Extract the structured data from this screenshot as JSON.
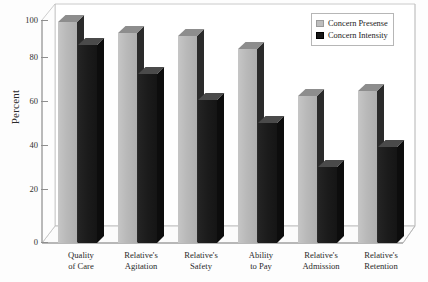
{
  "chart_data": {
    "type": "bar",
    "title": "",
    "xlabel": "",
    "ylabel": "Percent",
    "ylim": [
      0,
      100
    ],
    "yticks": [
      0,
      20,
      40,
      60,
      80,
      100
    ],
    "grid": false,
    "legend_position": "top-right",
    "style": "3d-grouped-bar",
    "categories": [
      "Quality\nof Care",
      "Relative's\nAgitation",
      "Relative's\nSafety",
      "Ability\nto Pay",
      "Relative's\nAdmission",
      "Relative's\nRetention"
    ],
    "category_lines": [
      [
        "Quality",
        "of Care"
      ],
      [
        "Relative's",
        "Agitation"
      ],
      [
        "Relative's",
        "Safety"
      ],
      [
        "Ability",
        "to Pay"
      ],
      [
        "Relative's",
        "Admission"
      ],
      [
        "Relative's",
        "Retention"
      ]
    ],
    "series": [
      {
        "name": "Concern Presense",
        "color": "#bdbdbd",
        "values": [
          99,
          94,
          93,
          87,
          66,
          68
        ]
      },
      {
        "name": "Concern Intensity",
        "color": "#171717",
        "values": [
          89,
          76,
          64,
          54,
          34,
          43
        ]
      }
    ]
  },
  "axis": {
    "y_title": "Percent",
    "y_tick_labels": [
      "100",
      "80",
      "60",
      "40",
      "20",
      "0"
    ]
  },
  "legend": {
    "items": [
      {
        "label": "Concern Presense"
      },
      {
        "label": "Concern Intensity"
      }
    ]
  }
}
